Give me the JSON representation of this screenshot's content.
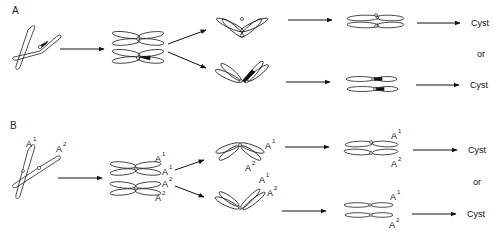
{
  "panels": [
    {
      "label": "A",
      "outcomes": [
        {
          "label": "Cyst"
        },
        {
          "label": "Cyst"
        }
      ],
      "separator": "or"
    },
    {
      "label": "B",
      "outcomes": [
        {
          "label": "Cyst"
        },
        {
          "label": "Cyst"
        }
      ],
      "separator": "or",
      "allele_labels": {
        "a1": "A",
        "a1_sup": "1",
        "a2": "A",
        "a2_sup": "2"
      }
    }
  ]
}
